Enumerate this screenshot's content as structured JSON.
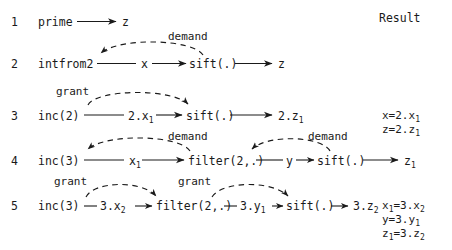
{
  "diagram": {
    "title_column": "Result",
    "rows": [
      {
        "number": "1",
        "nodes": [
          "prime",
          "z"
        ],
        "expression": "prime ⟶ z",
        "arcs": [],
        "results": []
      },
      {
        "number": "2",
        "nodes": [
          "intfrom2",
          "x",
          "sift(.)",
          "z"
        ],
        "expression": "intfrom2 —— x ⟶ sift(.) ⟶ z",
        "arcs": [
          {
            "label": "demand",
            "direction": "left",
            "position": "above"
          }
        ],
        "results": []
      },
      {
        "number": "3",
        "nodes": [
          "inc(2)",
          "2.x1",
          "sift(.)",
          "2.z1"
        ],
        "expression": "inc(2) —— 2.x₁ ⟶ sift(.) ⟶ 2.z₁",
        "arcs": [
          {
            "label": "grant",
            "direction": "right",
            "position": "above"
          }
        ],
        "results": [
          "x=2.x₁",
          "z=2.z₁"
        ]
      },
      {
        "number": "4",
        "nodes": [
          "inc(3)",
          "x1",
          "filter(2,.)",
          "y",
          "sift(.)",
          "z1"
        ],
        "expression": "inc(3) —— x₁ ⟶ filter(2,.) —— y ⟶ sift(.) ⟶ z₁",
        "arcs": [
          {
            "label": "demand",
            "direction": "left",
            "position": "above"
          },
          {
            "label": "demand",
            "direction": "left",
            "position": "above-right"
          }
        ],
        "results": []
      },
      {
        "number": "5",
        "nodes": [
          "inc(3)",
          "3.x2",
          "filter(2,.)",
          "3.y1",
          "sift(.)",
          "3.z2"
        ],
        "expression": "inc(3) — 3.x₂ ⟶ filter(2,.) — 3.y₁ ⟶ sift(.) ⟶ 3.z₂",
        "arcs": [
          {
            "label": "grant",
            "direction": "right",
            "position": "above"
          },
          {
            "label": "grant",
            "direction": "right",
            "position": "above-right"
          }
        ],
        "results": [
          "x₁=3.x₂",
          "y=3.y₁",
          "z₁=3.z₂"
        ]
      }
    ],
    "arc_labels": {
      "demand_r2": "demand",
      "grant_r3": "grant",
      "demand_r4_left": "demand",
      "demand_r4_right": "demand",
      "grant_r5_left": "grant",
      "grant_r5_right": "grant"
    },
    "row_labels": {
      "r1": "1",
      "r2": "2",
      "r3": "3",
      "r4": "4",
      "r5": "5"
    },
    "text": {
      "r1_prime": "prime",
      "r1_z": "z",
      "r2_intfrom2": "intfrom2",
      "r2_x": "x",
      "r2_sift": "sift(.)",
      "r2_z": "z",
      "r3_inc2": "inc(2)",
      "r3_2x1": "2.x",
      "r3_2x1_sub": "1",
      "r3_sift": "sift(.)",
      "r3_2z1": "2.z",
      "r3_2z1_sub": "1",
      "r4_inc3": "inc(3)",
      "r4_x1": "x",
      "r4_x1_sub": "1",
      "r4_filter": "filter(2,.)",
      "r4_y": "y",
      "r4_sift": "sift(.)",
      "r4_z1": "z",
      "r4_z1_sub": "1",
      "r5_inc3": "inc(3)",
      "r5_3x2": "3.x",
      "r5_3x2_sub": "2",
      "r5_filter": "filter(2,.)",
      "r5_3y1": "3.y",
      "r5_3y1_sub": "1",
      "r5_sift": "sift(.)",
      "r5_3z2": "3.z",
      "r5_3z2_sub": "2"
    },
    "results_text": {
      "r3_l1_lhs": "x=2.x",
      "r3_l1_sub": "1",
      "r3_l2_lhs": "z=2.z",
      "r3_l2_sub": "1",
      "r5_l1_lhs": "x",
      "r5_l1_sub1": "1",
      "r5_l1_mid": "=3.x",
      "r5_l1_sub2": "2",
      "r5_l2_lhs": "y=3.y",
      "r5_l2_sub": "1",
      "r5_l3_lhs": "z",
      "r5_l3_sub1": "1",
      "r5_l3_mid": "=3.z",
      "r5_l3_sub2": "2"
    },
    "colors": {
      "ink": "#1a1a1a",
      "background": "#ffffff"
    }
  }
}
